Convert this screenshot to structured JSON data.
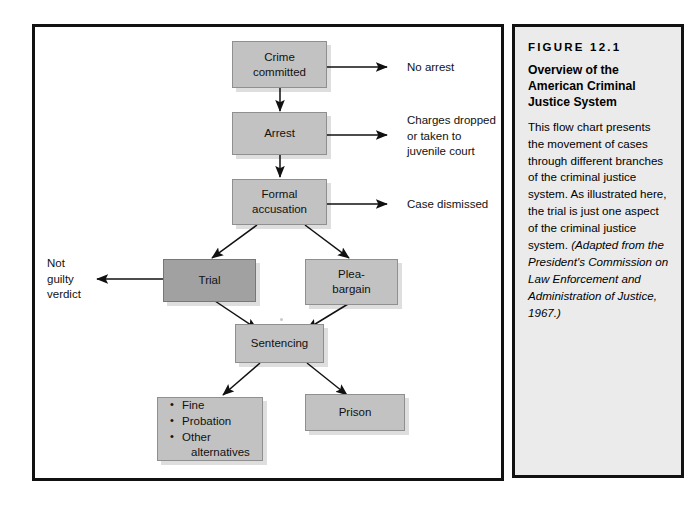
{
  "figure": {
    "nodes": [
      {
        "id": "crime-committed",
        "label": "Crime\ncommitted"
      },
      {
        "id": "arrest",
        "label": "Arrest"
      },
      {
        "id": "formal-accusation",
        "label": "Formal\naccusation"
      },
      {
        "id": "trial",
        "label": "Trial"
      },
      {
        "id": "plea-bargain",
        "label": "Plea-\nbargain"
      },
      {
        "id": "sentencing",
        "label": "Sentencing"
      },
      {
        "id": "prison",
        "label": "Prison"
      }
    ],
    "outcome_box": {
      "id": "alternatives",
      "items": [
        "Fine",
        "Probation",
        "Other"
      ],
      "item_3_continuation": "alternatives"
    },
    "exit_labels": [
      {
        "id": "no-arrest",
        "text": "No arrest"
      },
      {
        "id": "charges-dropped",
        "text": "Charges dropped\nor taken to\njuvenile court"
      },
      {
        "id": "case-dismissed",
        "text": "Case dismissed"
      },
      {
        "id": "not-guilty",
        "text": "Not\nguilty\nverdict"
      }
    ],
    "colors": {
      "node_fill": "#c2c2c2",
      "node_fill_highlight": "#a1a1a1",
      "panel_border": "#111111",
      "caption_background": "#ebebeb"
    }
  },
  "caption": {
    "figure_number": "FIGURE 12.1",
    "title": "Overview of the American Criminal Justice System",
    "body": "This flow chart presents the movement of cases through different branches of the criminal justice system. As illustrated here, the trial is just one aspect of the criminal justice system.",
    "attribution": "(Adapted from the President's Commission on Law Enforcement and Administration of Justice, 1967.)"
  }
}
